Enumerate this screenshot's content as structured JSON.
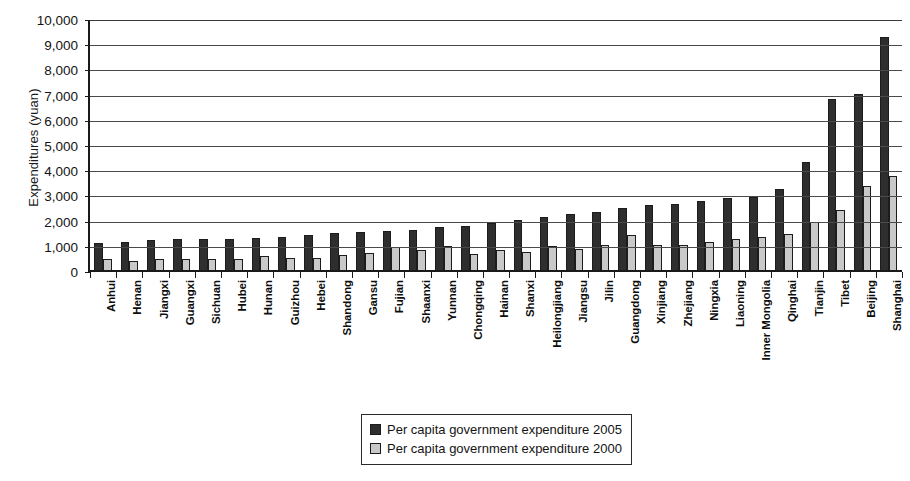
{
  "chart_data": {
    "type": "bar",
    "title": "",
    "xlabel": "",
    "ylabel": "Expenditures (yuan)",
    "ylim": [
      0,
      10000
    ],
    "ytick_step": 1000,
    "ytick_labels": [
      "10,000",
      "9,000",
      "8,000",
      "7,000",
      "6,000",
      "5,000",
      "4,000",
      "3,000",
      "2,000",
      "1,000",
      "0"
    ],
    "grid": true,
    "legend_position": "bottom-center",
    "categories": [
      "Anhui",
      "Henan",
      "Jiangxi",
      "Guangxi",
      "Sichuan",
      "Hubei",
      "Hunan",
      "Guizhou",
      "Hebei",
      "Shandong",
      "Gansu",
      "Fujian",
      "Shaanxi",
      "Yunnan",
      "Chongqing",
      "Hainan",
      "Shanxi",
      "Heilongjiang",
      "Jiangsu",
      "Jilin",
      "Guangdong",
      "Xinjiang",
      "Zhejiang",
      "Ningxia",
      "Liaoning",
      "Inner Mongolia",
      "Qinghai",
      "Tianjin",
      "Tibet",
      "Beijing",
      "Shanghai"
    ],
    "series": [
      {
        "name": "Per capita government expenditure 2005",
        "color": "#2e2e2e",
        "values": [
          1150,
          1200,
          1290,
          1300,
          1320,
          1320,
          1360,
          1380,
          1450,
          1540,
          1600,
          1640,
          1660,
          1800,
          1820,
          1960,
          2060,
          2180,
          2310,
          2400,
          2560,
          2660,
          2700,
          2830,
          2940,
          2970,
          3290,
          4350,
          6880,
          7080,
          9320
        ]
      },
      {
        "name": "Per capita government expenditure 2000",
        "color": "#c9c9c9",
        "values": [
          500,
          450,
          510,
          530,
          530,
          530,
          630,
          540,
          560,
          690,
          740,
          980,
          870,
          1020,
          700,
          870,
          780,
          1050,
          920,
          1060,
          1450,
          1060,
          1070,
          1200,
          1300,
          1380,
          1490,
          1990,
          2460,
          3400,
          3800
        ]
      }
    ]
  },
  "legend": {
    "items": [
      {
        "label": "Per capita government expenditure 2005",
        "swatch": "dark"
      },
      {
        "label": "Per capita government expenditure 2000",
        "swatch": "light"
      }
    ]
  },
  "colors": {
    "series_2005": "#2e2e2e",
    "series_2000": "#c9c9c9",
    "axis": "#1a1a1a",
    "gridline": "#4a4a4a",
    "background": "#ffffff"
  }
}
